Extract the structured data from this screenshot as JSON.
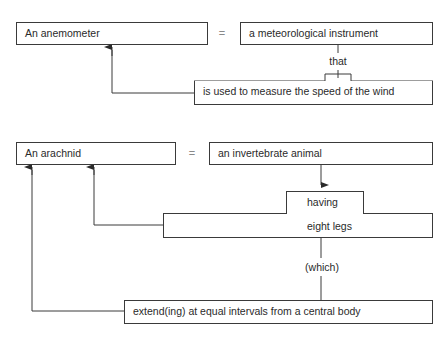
{
  "diagram1": {
    "term": "An anemometer",
    "equals": "=",
    "genus": "a meteorological instrument",
    "connector": "that",
    "differentia": "is used to measure the speed of the wind"
  },
  "diagram2": {
    "term": "An arachnid",
    "equals": "=",
    "genus": "an invertebrate animal",
    "connector1": "having",
    "feature": "eight legs",
    "connector2": "(which)",
    "differentia": "extend(ing) at equal intervals from a central body"
  }
}
